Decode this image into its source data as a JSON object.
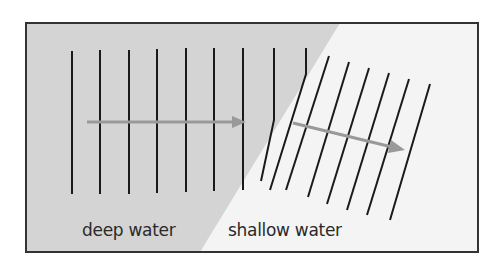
{
  "diagram": {
    "regions": [
      {
        "name": "deep water",
        "color": "#d4d4d4"
      },
      {
        "name": "shallow water",
        "color": "#f4f4f4"
      }
    ],
    "labels": {
      "deep": "deep water",
      "shallow": "shallow water"
    },
    "colors": {
      "border": "#333333",
      "wavefront": "#1a1a1a",
      "arrow": "#999999"
    }
  }
}
